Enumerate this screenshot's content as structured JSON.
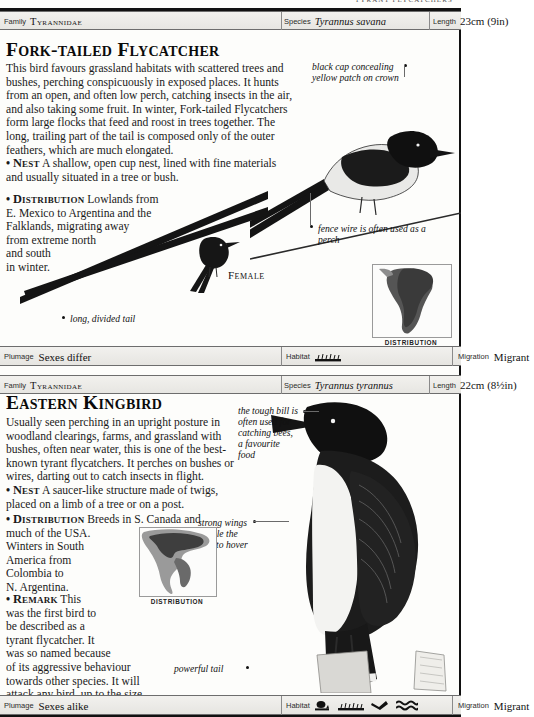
{
  "running_head": "TYRANT FLYCATCHERS",
  "entries": [
    {
      "meta": {
        "family_label": "Family",
        "family_value": "Tyrannidae",
        "species_label": "Species",
        "species_value": "Tyrannus savana",
        "length_label": "Length",
        "length_value": "23cm (9in)"
      },
      "title": "Fork-tailed Flycatcher",
      "paragraphs": [
        "This bird favours grassland habitats with scattered trees and bushes, perching conspicuously in exposed places. It hunts from an open, and often low perch, catching insects in the air, and also taking some fruit. In winter, Fork-tailed Flycatchers form large flocks that feed and roost in trees together. The long, trailing part of the tail is composed only of the outer feathers, which are much elongated."
      ],
      "nest_keyword": "Nest",
      "nest_text": "A shallow, open cup nest, lined with fine materials and usually situated in a tree or bush.",
      "distribution_keyword": "Distribution",
      "distribution_lines": [
        "Lowlands from",
        "E. Mexico to Argentina and the",
        "Falklands, migrating away",
        "from extreme north",
        "and south",
        "in winter."
      ],
      "annotations": [
        "black cap concealing yellow patch on crown",
        "fence wire is often used as a perch",
        "long, divided tail"
      ],
      "figure_label": "Female",
      "map_caption": "DISTRIBUTION",
      "footer": {
        "plumage_label": "Plumage",
        "plumage_value": "Sexes differ",
        "habitat_label": "Habitat",
        "habitat_icons": [
          "grassland-icon"
        ],
        "migration_label": "Migration",
        "migration_value": "Migrant"
      }
    },
    {
      "meta": {
        "family_label": "Family",
        "family_value": "Tyrannidae",
        "species_label": "Species",
        "species_value": "Tyrannus tyrannus",
        "length_label": "Length",
        "length_value": "22cm (8½in)"
      },
      "title": "Eastern Kingbird",
      "paragraphs": [
        "Usually seen perching in an upright posture in woodland clearings, farms, and grassland with bushes, often near water, this is one of the best-known tyrant flycatchers. It perches on bushes or wires, darting out to catch insects in flight."
      ],
      "nest_keyword": "Nest",
      "nest_text": "A saucer-like structure made of twigs, placed on a limb of a tree or on a post.",
      "distribution_keyword": "Distribution",
      "distribution_lines": [
        "Breeds in S. Canada and",
        "much of the USA.",
        "Winters in South",
        "America from",
        "Colombia to",
        "N. Argentina."
      ],
      "remark_keyword": "Remark",
      "remark_lines": [
        "This",
        "was the first bird to",
        "be described as a",
        "tyrant flycatcher. It",
        "was so named because",
        "of its aggressive behaviour",
        "towards other species. It will",
        "attack any bird, up to the size",
        "of a hawk, appearing in its habitat."
      ],
      "annotations": [
        "the tough bill is often used for catching bees, a favourite food",
        "strong wings enable the bird to hover",
        "powerful tail"
      ],
      "map_caption": "DISTRIBUTION",
      "footer": {
        "plumage_label": "Plumage",
        "plumage_value": "Sexes alike",
        "habitat_label": "Habitat",
        "habitat_icons": [
          "bush-icon",
          "grassland-icon",
          "flying-bird-icon",
          "water-icon"
        ],
        "migration_label": "Migration",
        "migration_value": "Migrant"
      }
    }
  ],
  "colors": {
    "ink": "#111111",
    "rule": "#6d6d6d",
    "bar_bg": "#efeeea",
    "map_land": "#6e6e6e",
    "map_range": "#3a3a3a"
  }
}
